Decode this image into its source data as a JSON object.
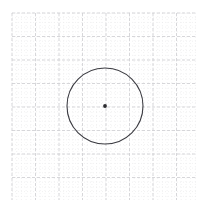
{
  "canvas": {
    "width": 209,
    "height": 215,
    "background_color": "#ffffff",
    "title": "Circle on graph paper"
  },
  "grid": {
    "label": "graph-paper-grid",
    "origin_x": 12,
    "origin_y": 13,
    "end_x": 196,
    "end_y": 200,
    "minor_spacing": 4.7,
    "minor_color": "#e8e8ea",
    "minor_dash": "1 2",
    "minor_width": 0.6,
    "major_spacing": 23.5,
    "major_color": "#d2d2d6",
    "major_dash": "3 2",
    "major_width": 0.9,
    "major_columns": 8,
    "major_rows": 8
  },
  "shapes": {
    "circle": {
      "label": "circle-outline",
      "center_x": 105,
      "center_y": 106,
      "radius": 38,
      "stroke_color": "#3b3b41",
      "stroke_width": 1.1,
      "fill": "none"
    },
    "center_point": {
      "label": "circle-center-dot",
      "x": 105,
      "y": 106,
      "radius": 1.9,
      "fill_color": "#2c2c30"
    }
  }
}
